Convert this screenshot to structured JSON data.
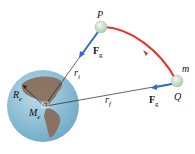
{
  "diagram": {
    "labels": {
      "P": "P",
      "Q": "Q",
      "m": "m",
      "Fg_label": "F",
      "Fg_sub": "g",
      "ri_label": "r",
      "ri_sub": "i",
      "rf_label": "r",
      "rf_sub": "f",
      "Re_label": "R",
      "Re_sub": "e",
      "Me_label": "M",
      "Me_sub": "e"
    },
    "colors": {
      "path": "#e8322a",
      "force": "#2a6fd0",
      "earth_ocean": "#8cc0d8",
      "land": "#8a6a55",
      "ball": "#d6e8d4",
      "line": "#222222"
    }
  }
}
